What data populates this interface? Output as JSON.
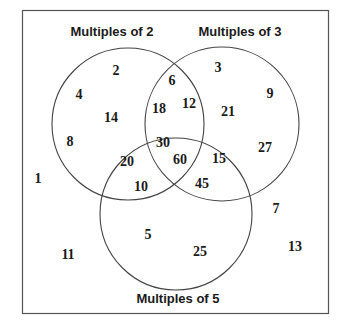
{
  "diagram": {
    "type": "venn",
    "frame_color": "#555555",
    "stroke_color": "#444444",
    "sets": [
      {
        "id": "A",
        "label": "Multiples of 2",
        "cx": 128,
        "cy": 124,
        "r": 76,
        "label_x": 112,
        "label_y": 36
      },
      {
        "id": "B",
        "label": "Multiples of 3",
        "cx": 222,
        "cy": 124,
        "r": 77,
        "label_x": 240,
        "label_y": 36
      },
      {
        "id": "C",
        "label": "Multiples of 5",
        "cx": 176,
        "cy": 214,
        "r": 76,
        "label_x": 178,
        "label_y": 303
      }
    ],
    "regions": [
      {
        "region": "A only",
        "values": [
          2,
          4,
          8,
          14
        ]
      },
      {
        "region": "A and B only",
        "values": [
          6,
          12,
          18
        ]
      },
      {
        "region": "B only",
        "values": [
          3,
          9,
          21,
          27
        ]
      },
      {
        "region": "A and C only",
        "values": [
          10,
          20
        ]
      },
      {
        "region": "A and B and C",
        "values": [
          30,
          60
        ]
      },
      {
        "region": "B and C only",
        "values": [
          15,
          45
        ]
      },
      {
        "region": "C only",
        "values": [
          5,
          25
        ]
      },
      {
        "region": "outside",
        "values": [
          1,
          7,
          11,
          13
        ]
      }
    ],
    "numbers": [
      {
        "v": "2",
        "x": 116,
        "y": 75
      },
      {
        "v": "4",
        "x": 79,
        "y": 99
      },
      {
        "v": "14",
        "x": 111,
        "y": 122
      },
      {
        "v": "8",
        "x": 70,
        "y": 146
      },
      {
        "v": "6",
        "x": 172,
        "y": 85
      },
      {
        "v": "18",
        "x": 159,
        "y": 113
      },
      {
        "v": "12",
        "x": 189,
        "y": 108
      },
      {
        "v": "3",
        "x": 218,
        "y": 72
      },
      {
        "v": "9",
        "x": 270,
        "y": 98
      },
      {
        "v": "21",
        "x": 228,
        "y": 116
      },
      {
        "v": "27",
        "x": 265,
        "y": 152
      },
      {
        "v": "20",
        "x": 127,
        "y": 166
      },
      {
        "v": "10",
        "x": 141,
        "y": 191
      },
      {
        "v": "30",
        "x": 163,
        "y": 147
      },
      {
        "v": "60",
        "x": 180,
        "y": 164
      },
      {
        "v": "15",
        "x": 219,
        "y": 163
      },
      {
        "v": "45",
        "x": 202,
        "y": 188
      },
      {
        "v": "1",
        "x": 38,
        "y": 183
      },
      {
        "v": "5",
        "x": 148,
        "y": 239
      },
      {
        "v": "25",
        "x": 200,
        "y": 256
      },
      {
        "v": "11",
        "x": 68,
        "y": 259
      },
      {
        "v": "7",
        "x": 276,
        "y": 213
      },
      {
        "v": "13",
        "x": 295,
        "y": 251
      }
    ]
  }
}
